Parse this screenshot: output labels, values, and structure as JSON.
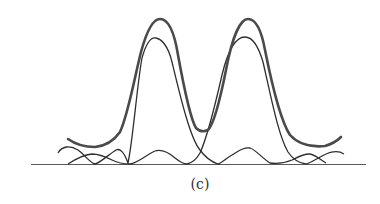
{
  "figure": {
    "label": "(c)",
    "colors": {
      "background": "#ffffff",
      "envelope": "#4a4a4a",
      "component": "#2e2e2e",
      "axis": "#555555"
    },
    "curves": [
      {
        "name": "combined-envelope",
        "style": "thick"
      },
      {
        "name": "component-left",
        "style": "thin"
      },
      {
        "name": "component-right",
        "style": "thin"
      }
    ]
  }
}
